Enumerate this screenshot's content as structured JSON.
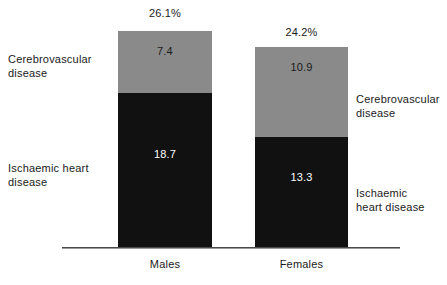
{
  "chart_data": {
    "type": "bar",
    "subtype": "stacked",
    "title": "",
    "xlabel": "",
    "ylabel": "",
    "grid": false,
    "legend_position": "annotations-beside-bars",
    "categories": [
      "Males",
      "Females"
    ],
    "series": [
      {
        "name": "Cerebrovascular disease",
        "values": [
          7.4,
          10.9
        ],
        "color": "#8a8a8a"
      },
      {
        "name": "Ischaemic heart disease",
        "values": [
          18.7,
          13.3
        ],
        "color": "#111111"
      }
    ],
    "totals": [
      "26.1%",
      "24.2%"
    ],
    "total_values": [
      26.1,
      24.2
    ],
    "value_labels": {
      "males": {
        "cerebrovascular": "7.4",
        "ischaemic": "18.7"
      },
      "females": {
        "cerebrovascular": "10.9",
        "ischaemic": "13.3"
      }
    },
    "ylim": [
      0,
      26.1
    ]
  },
  "axis": {
    "category_labels": {
      "males": "Males",
      "females": "Females"
    }
  },
  "annotations": {
    "left_cerebrovascular": "Cerebrovascular\ndisease",
    "left_ischaemic": "Ischaemic heart\ndisease",
    "right_cerebrovascular": "Cerebrovascular\ndisease",
    "right_ischaemic": "Ischaemic\nheart disease"
  },
  "colors": {
    "cerebrovascular": "#8a8a8a",
    "ischaemic": "#111111",
    "axis": "#4a4a4a",
    "background": "#ffffff",
    "text": "#1a1a1a",
    "value_text_on_dark": "#ffffff"
  }
}
